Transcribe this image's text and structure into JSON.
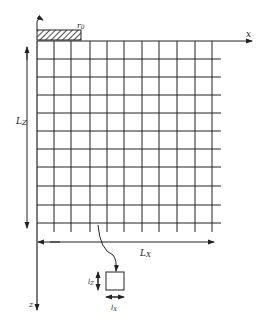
{
  "figure": {
    "type": "finite-difference grid diagram",
    "colors": {
      "ink": "#222222",
      "background": "#ffffff"
    },
    "axes": {
      "x_label": "x",
      "z_label": "z"
    },
    "source": {
      "label": "r",
      "subscript": "0",
      "hatched": true
    },
    "dimensions": {
      "grid_width_label": "L",
      "grid_width_sub": "X",
      "grid_height_label": "L",
      "grid_height_sub": "Z"
    },
    "cell_detail": {
      "width_label": "l",
      "width_sub": "X",
      "height_label": "l",
      "height_sub": "Z"
    },
    "grid": {
      "columns": 10,
      "rows": 10,
      "x_lines": [
        37,
        54,
        71,
        90,
        107,
        124,
        142,
        159,
        177,
        195,
        212
      ],
      "z_lines": [
        41,
        59,
        77,
        95,
        113,
        131,
        149,
        167,
        186,
        205,
        223
      ]
    }
  }
}
